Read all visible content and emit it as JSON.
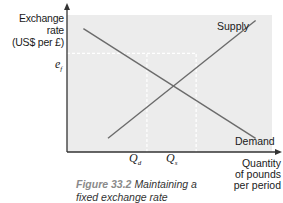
{
  "chart_data": {
    "type": "line",
    "title": "",
    "ylabel": "Exchange rate (US$ per £)",
    "xlabel": "Quantity of pounds per period",
    "xlim": [
      0,
      10
    ],
    "ylim": [
      0,
      10
    ],
    "grid": false,
    "series": [
      {
        "name": "Supply",
        "x": [
          2,
          9.2
        ],
        "y": [
          1.0,
          9.6
        ]
      },
      {
        "name": "Demand",
        "x": [
          0.8,
          9.2
        ],
        "y": [
          9.0,
          1.0
        ]
      }
    ],
    "reference_lines": [
      {
        "type": "horizontal",
        "label": "e_f",
        "y": 7.2,
        "x_range": [
          0,
          6.3
        ]
      },
      {
        "type": "vertical",
        "label": "Q_d",
        "x": 3.9,
        "y_range": [
          0,
          7.2
        ]
      },
      {
        "type": "vertical",
        "label": "Q_s",
        "x": 6.3,
        "y_range": [
          0,
          7.2
        ]
      }
    ],
    "annotations": [
      "Supply",
      "Demand",
      "e_f",
      "Q_d",
      "Q_s"
    ]
  },
  "labels": {
    "y_axis_line1": "Exchange rate",
    "y_axis_line2": "(US$ per £)",
    "x_axis_line1": "Quantity",
    "x_axis_line2": "of pounds",
    "x_axis_line3": "per period",
    "supply": "Supply",
    "demand": "Demand",
    "ef_main": "e",
    "ef_sub": "f",
    "qd_main": "Q",
    "qd_sub": "d",
    "qs_main": "Q",
    "qs_sub": "s"
  },
  "caption": {
    "figure": "Figure 33.2",
    "text_line1": "Maintaining a",
    "text_line2": "fixed exchange rate"
  },
  "colors": {
    "plot_bg": "#ececec",
    "axis": "#333333",
    "curve": "#6b6b6b",
    "guide": "#ffffff"
  }
}
